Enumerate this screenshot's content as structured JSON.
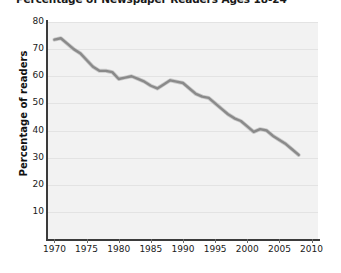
{
  "chart_data": {
    "type": "line",
    "title": "Percentage of Newspaper Readers Ages 18-24",
    "xlabel": "",
    "ylabel": "Percentage of readers",
    "xlim": [
      1969,
      2011
    ],
    "ylim": [
      0,
      80
    ],
    "grid": true,
    "legend": "none",
    "line_color": "#8a8a8a",
    "plot_background": "#f2f2f2",
    "axis_color": "#3b3b3b",
    "ytick_labels": [
      "80",
      "70",
      "60",
      "50",
      "40",
      "30",
      "20",
      "10"
    ],
    "ytick_values": [
      80,
      70,
      60,
      50,
      40,
      30,
      20,
      10
    ],
    "xtick_labels": [
      "1970",
      "1975",
      "1980",
      "1985",
      "1990",
      "1995",
      "2000",
      "2005",
      "2010"
    ],
    "xtick_values": [
      1970,
      1975,
      1980,
      1985,
      1990,
      1995,
      2000,
      2005,
      2010
    ],
    "x": [
      1970,
      1971,
      1972,
      1973,
      1974,
      1975,
      1976,
      1977,
      1978,
      1979,
      1980,
      1981,
      1982,
      1983,
      1984,
      1985,
      1986,
      1987,
      1988,
      1989,
      1990,
      1991,
      1992,
      1993,
      1994,
      1995,
      1996,
      1997,
      1998,
      1999,
      2000,
      2001,
      2002,
      2003,
      2004,
      2005,
      2006,
      2007,
      2008
    ],
    "values": [
      73.5,
      74.0,
      72.0,
      70.0,
      68.5,
      66.0,
      63.5,
      62.0,
      62.0,
      61.5,
      59.0,
      59.5,
      60.0,
      59.0,
      58.0,
      56.5,
      55.5,
      57.0,
      58.5,
      58.0,
      57.5,
      55.5,
      53.5,
      52.5,
      52.0,
      50.0,
      48.0,
      46.0,
      44.5,
      43.5,
      41.5,
      39.5,
      40.5,
      40.0,
      38.0,
      36.5,
      35.0,
      33.0,
      31.0
    ]
  }
}
